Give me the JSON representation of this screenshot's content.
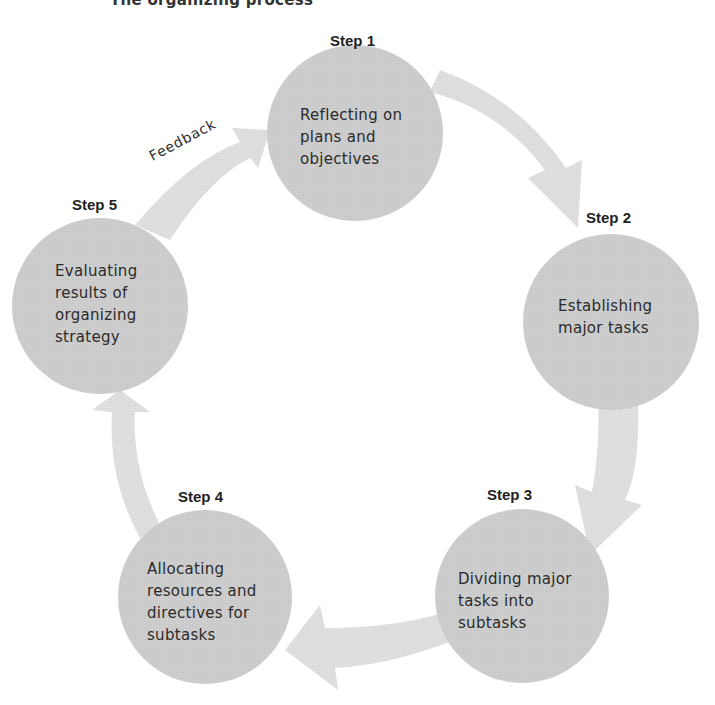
{
  "page": {
    "cut_off_title": "The organizing process"
  },
  "diagram": {
    "type": "cycle",
    "feedback_label": "Feedback",
    "colors": {
      "circle_fill": "#cbcbcb",
      "arrow_fill": "#dedede",
      "text": "#2b2b2b",
      "background": "#ffffff"
    },
    "steps": [
      {
        "label": "Step 1",
        "text": "Reflecting on\nplans and\nobjectives"
      },
      {
        "label": "Step 2",
        "text": "Establishing\nmajor tasks"
      },
      {
        "label": "Step 3",
        "text": "Dividing major\ntasks into\nsubtasks"
      },
      {
        "label": "Step 4",
        "text": "Allocating\nresources and\ndirectives for\nsubtasks"
      },
      {
        "label": "Step 5",
        "text": "Evaluating\nresults of\norganizing\nstrategy"
      }
    ]
  }
}
